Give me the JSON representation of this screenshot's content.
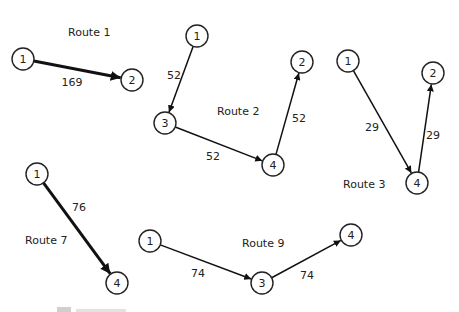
{
  "routes": [
    {
      "id": "route-1",
      "label": "Route 1",
      "label_pos": [
        68,
        32
      ],
      "nodes": [
        {
          "id": "1",
          "label": "1",
          "x": 23,
          "y": 59
        },
        {
          "id": "2",
          "label": "2",
          "x": 132,
          "y": 80
        }
      ],
      "edges": [
        {
          "from": "1",
          "to": "2",
          "weight": "169",
          "weight_pos": [
            72,
            82
          ],
          "thick": true
        }
      ]
    },
    {
      "id": "route-2",
      "label": "Route 2",
      "label_pos": [
        217,
        111
      ],
      "nodes": [
        {
          "id": "1",
          "label": "1",
          "x": 197,
          "y": 36
        },
        {
          "id": "3",
          "label": "3",
          "x": 165,
          "y": 123
        },
        {
          "id": "4",
          "label": "4",
          "x": 273,
          "y": 165
        },
        {
          "id": "2",
          "label": "2",
          "x": 302,
          "y": 62
        }
      ],
      "edges": [
        {
          "from": "1",
          "to": "3",
          "weight": "52",
          "weight_pos": [
            174,
            75
          ],
          "thick": false
        },
        {
          "from": "3",
          "to": "4",
          "weight": "52",
          "weight_pos": [
            213,
            156
          ],
          "thick": false
        },
        {
          "from": "4",
          "to": "2",
          "weight": "52",
          "weight_pos": [
            299,
            118
          ],
          "thick": false
        }
      ]
    },
    {
      "id": "route-3",
      "label": "Route 3",
      "label_pos": [
        343,
        184
      ],
      "nodes": [
        {
          "id": "1",
          "label": "1",
          "x": 348,
          "y": 61
        },
        {
          "id": "4",
          "label": "4",
          "x": 417,
          "y": 183
        },
        {
          "id": "2",
          "label": "2",
          "x": 433,
          "y": 73
        }
      ],
      "edges": [
        {
          "from": "1",
          "to": "4",
          "weight": "29",
          "weight_pos": [
            372,
            127
          ],
          "thick": false
        },
        {
          "from": "4",
          "to": "2",
          "weight": "29",
          "weight_pos": [
            433,
            135
          ],
          "thick": false
        }
      ]
    },
    {
      "id": "route-7",
      "label": "Route 7",
      "label_pos": [
        25,
        240
      ],
      "nodes": [
        {
          "id": "1",
          "label": "1",
          "x": 37,
          "y": 174
        },
        {
          "id": "4",
          "label": "4",
          "x": 117,
          "y": 283
        }
      ],
      "edges": [
        {
          "from": "1",
          "to": "4",
          "weight": "76",
          "weight_pos": [
            79,
            207
          ],
          "thick": true
        }
      ]
    },
    {
      "id": "route-9",
      "label": "Route 9",
      "label_pos": [
        242,
        243
      ],
      "nodes": [
        {
          "id": "1",
          "label": "1",
          "x": 150,
          "y": 241
        },
        {
          "id": "3",
          "label": "3",
          "x": 262,
          "y": 283
        },
        {
          "id": "4",
          "label": "4",
          "x": 351,
          "y": 235
        }
      ],
      "edges": [
        {
          "from": "1",
          "to": "3",
          "weight": "74",
          "weight_pos": [
            198,
            273
          ],
          "thick": false
        },
        {
          "from": "3",
          "to": "4",
          "weight": "74",
          "weight_pos": [
            307,
            275
          ],
          "thick": false
        }
      ]
    }
  ],
  "caption": {
    "visible_text": "",
    "note_clipped": true
  },
  "colors": {
    "ink": "#111111",
    "background": "#ffffff"
  }
}
